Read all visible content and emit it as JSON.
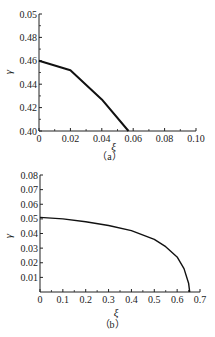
{
  "chart_data": [
    {
      "panel": "(a)",
      "type": "line",
      "title": "",
      "caption": "（a）",
      "xlabel": "ξ",
      "ylabel": "γ",
      "xlim": [
        0,
        0.1
      ],
      "ylim": [
        0.4,
        0.5
      ],
      "x_ticks": [
        "0",
        "0.02",
        "0.04",
        "0.06",
        "0.08",
        "0.10"
      ],
      "y_ticks": [
        "0.40",
        "0.42",
        "0.44",
        "0.46",
        "0.48",
        "0.05"
      ],
      "grid": false,
      "series": [
        {
          "name": "γ(ξ)",
          "x": [
            0,
            0.02,
            0.04,
            0.057
          ],
          "y": [
            0.46,
            0.452,
            0.427,
            0.4
          ]
        }
      ]
    },
    {
      "panel": "(b)",
      "type": "line",
      "title": "",
      "caption": "（b）",
      "xlabel": "ξ",
      "ylabel": "γ",
      "xlim": [
        0,
        0.7
      ],
      "ylim": [
        0,
        0.08
      ],
      "x_ticks": [
        "0",
        "0.1",
        "0.2",
        "0.3",
        "0.4",
        "0.5",
        "0.6",
        "0.7"
      ],
      "y_ticks": [
        "0.01",
        "0.02",
        "0.03",
        "0.04",
        "0.05",
        "0.06",
        "0.07",
        "0.08"
      ],
      "grid": false,
      "series": [
        {
          "name": "γ(ξ)",
          "x": [
            0,
            0.1,
            0.2,
            0.3,
            0.4,
            0.5,
            0.55,
            0.6,
            0.63,
            0.65,
            0.655
          ],
          "y": [
            0.051,
            0.05,
            0.048,
            0.0455,
            0.042,
            0.036,
            0.031,
            0.024,
            0.016,
            0.006,
            0.0
          ]
        }
      ]
    }
  ]
}
